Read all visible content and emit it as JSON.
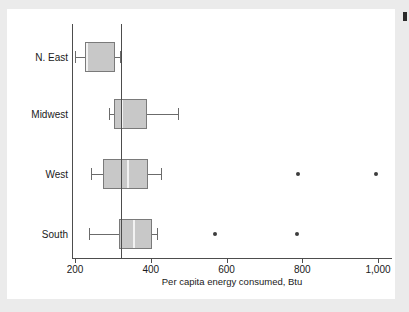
{
  "chart_data": {
    "type": "box",
    "title": "",
    "xlabel": "Per capita energy consumed, Btu",
    "ylabel": "",
    "orientation": "horizontal",
    "xlim": [
      170,
      1030
    ],
    "xticks": [
      200,
      400,
      600,
      800,
      1000
    ],
    "xticklabels": [
      "200",
      "400",
      "600",
      "800",
      "1,000"
    ],
    "grid": "vertical",
    "reference_line": 322,
    "categories": [
      "N. East",
      "Midwest",
      "West",
      "South"
    ],
    "boxes": [
      {
        "category": "N. East",
        "whisker_low": 200,
        "q1": 226,
        "median": 229,
        "q3": 305,
        "whisker_high": 318,
        "outliers": []
      },
      {
        "category": "Midwest",
        "whisker_low": 290,
        "q1": 303,
        "median": 322,
        "q3": 390,
        "whisker_high": 471,
        "outliers": []
      },
      {
        "category": "West",
        "whisker_low": 243,
        "q1": 275,
        "median": 338,
        "q3": 394,
        "whisker_high": 426,
        "outliers": [
          789,
          995
        ]
      },
      {
        "category": "South",
        "whisker_low": 237,
        "q1": 317,
        "median": 353,
        "q3": 403,
        "whisker_high": 416,
        "outliers": [
          570,
          787
        ]
      }
    ],
    "colors": {
      "box_fill": "#c8c8c8",
      "box_edge": "#7a7a7a",
      "median": "#f2f2f2",
      "whisker": "#6b6b6b",
      "outlier": "#3d3d3d",
      "axis": "#4d4d4d",
      "grid": "#e3e3e3",
      "plot_background": "#ffffff",
      "page_background": "#ebebeb"
    }
  }
}
